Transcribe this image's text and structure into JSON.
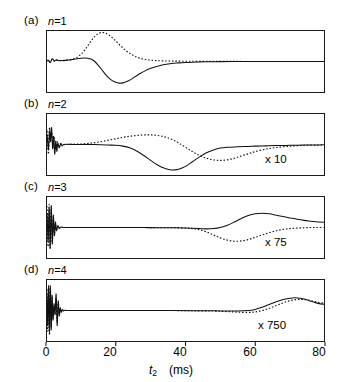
{
  "figure": {
    "panels": [
      {
        "label": "(a)",
        "n_label": "n",
        "n_eq": "=",
        "n_value": "1",
        "multiplier": ""
      },
      {
        "label": "(b)",
        "n_label": "n",
        "n_eq": "=",
        "n_value": "2",
        "multiplier": "x 10"
      },
      {
        "label": "(c)",
        "n_label": "n",
        "n_eq": "=",
        "n_value": "3",
        "multiplier": "x 75"
      },
      {
        "label": "(d)",
        "n_label": "n",
        "n_eq": "=",
        "n_value": "4",
        "multiplier": "x 750"
      }
    ],
    "x_axis": {
      "label_symbol": "t",
      "label_subscript": "2",
      "label_units": "(ms)",
      "ticks": [
        "0",
        "20",
        "40",
        "60",
        "80"
      ],
      "min": 0,
      "max": 80
    }
  },
  "chart_data": {
    "type": "line",
    "title": "",
    "xlabel": "t2 (ms)",
    "ylabel": "",
    "xlim": [
      0,
      80
    ],
    "grid": false,
    "legend": "none",
    "series_styles": {
      "solid": "solid line",
      "dotted": "dotted line"
    },
    "panels": [
      {
        "key": "a",
        "panel_label": "(a)",
        "annotation": "n = 1",
        "multiplier": 1,
        "ylim": [
          -1.15,
          1.15
        ],
        "baseline": 0,
        "solid": {
          "name": "solid",
          "x": [
            0,
            0.6,
            1.2,
            1.8,
            2.4,
            3,
            3.6,
            4.2,
            5,
            6,
            7,
            8,
            9,
            10,
            11,
            12,
            13,
            14,
            15,
            16,
            17,
            18,
            19,
            20,
            21,
            22,
            23,
            24,
            25,
            26,
            27,
            28,
            30,
            32,
            34,
            36,
            38,
            40,
            42,
            44,
            46,
            48,
            50,
            55,
            60,
            65,
            70,
            75,
            80
          ],
          "y": [
            0,
            0.05,
            -0.04,
            0.1,
            0.02,
            0.06,
            0.03,
            0.04,
            0.03,
            0.05,
            0.06,
            0.08,
            0.1,
            0.12,
            0.13,
            0.12,
            0.08,
            0.0,
            -0.14,
            -0.3,
            -0.46,
            -0.6,
            -0.7,
            -0.76,
            -0.79,
            -0.78,
            -0.74,
            -0.68,
            -0.6,
            -0.52,
            -0.44,
            -0.37,
            -0.25,
            -0.17,
            -0.11,
            -0.07,
            -0.05,
            -0.035,
            -0.025,
            -0.018,
            -0.012,
            -0.008,
            -0.005,
            -0.002,
            0,
            0,
            0,
            0,
            0
          ]
        },
        "dotted": {
          "name": "dotted",
          "x": [
            0,
            0.6,
            1.2,
            1.8,
            2.4,
            3,
            4,
            5,
            6,
            7,
            8,
            9,
            10,
            11,
            12,
            13,
            14,
            15,
            16,
            17,
            18,
            19,
            20,
            21,
            22,
            23,
            24,
            25,
            26,
            27,
            28,
            30,
            32,
            34,
            36,
            38,
            40,
            42,
            45,
            48,
            52,
            56,
            60,
            65,
            70,
            75,
            80
          ],
          "y": [
            0,
            0.04,
            -0.02,
            0.08,
            0.01,
            0.05,
            0.03,
            0.04,
            0.05,
            0.07,
            0.1,
            0.16,
            0.26,
            0.4,
            0.58,
            0.76,
            0.92,
            1.02,
            1.06,
            1.04,
            0.97,
            0.87,
            0.75,
            0.62,
            0.5,
            0.39,
            0.3,
            0.22,
            0.16,
            0.12,
            0.09,
            0.05,
            0.03,
            0.02,
            0.015,
            0.012,
            0.01,
            0.008,
            0.006,
            0.004,
            0.003,
            0.002,
            0.001,
            0,
            0,
            0,
            0
          ]
        }
      },
      {
        "key": "b",
        "panel_label": "(b)",
        "annotation": "n = 2",
        "multiplier": 10,
        "ylim": [
          -1.15,
          1.15
        ],
        "baseline": 0,
        "solid": {
          "name": "solid",
          "x": [
            0,
            0.3,
            0.7,
            1.0,
            1.3,
            1.6,
            1.9,
            2.2,
            2.5,
            2.8,
            3.1,
            3.4,
            3.8,
            4.2,
            4.6,
            5,
            6,
            8,
            10,
            12,
            14,
            16,
            18,
            20,
            22,
            24,
            26,
            28,
            30,
            32,
            34,
            36,
            38,
            40,
            42,
            44,
            46,
            48,
            50,
            52,
            55,
            58,
            60,
            63,
            66,
            70,
            74,
            78,
            80
          ],
          "y": [
            0,
            0.35,
            -0.2,
            0.5,
            0.1,
            0.62,
            -0.15,
            0.3,
            -0.35,
            0.12,
            -0.25,
            0.05,
            -0.12,
            0.02,
            -0.05,
            0.0,
            0.01,
            0.0,
            0.0,
            0.0,
            0.0,
            -0.01,
            -0.02,
            -0.03,
            -0.06,
            -0.12,
            -0.24,
            -0.4,
            -0.58,
            -0.75,
            -0.87,
            -0.93,
            -0.9,
            -0.8,
            -0.63,
            -0.45,
            -0.3,
            -0.2,
            -0.13,
            -0.1,
            -0.08,
            -0.07,
            -0.06,
            -0.05,
            -0.04,
            -0.03,
            -0.02,
            -0.015,
            -0.012
          ]
        },
        "dotted": {
          "name": "dotted",
          "x": [
            0,
            0.3,
            0.7,
            1.0,
            1.3,
            1.6,
            2.0,
            2.4,
            2.8,
            3.2,
            3.6,
            4,
            5,
            6,
            8,
            10,
            12,
            14,
            16,
            18,
            20,
            22,
            24,
            26,
            28,
            30,
            32,
            34,
            36,
            38,
            40,
            42,
            44,
            46,
            48,
            50,
            52,
            54,
            56,
            58,
            60,
            63,
            66,
            70,
            74,
            78,
            80
          ],
          "y": [
            0,
            0.55,
            -0.35,
            0.62,
            0.15,
            0.5,
            -0.1,
            0.25,
            -0.2,
            0.1,
            -0.1,
            0.03,
            0.0,
            0.0,
            0.01,
            0.02,
            0.04,
            0.07,
            0.11,
            0.16,
            0.21,
            0.26,
            0.3,
            0.33,
            0.35,
            0.35,
            0.33,
            0.28,
            0.19,
            0.06,
            -0.1,
            -0.26,
            -0.4,
            -0.5,
            -0.56,
            -0.58,
            -0.56,
            -0.5,
            -0.42,
            -0.34,
            -0.26,
            -0.17,
            -0.11,
            -0.06,
            -0.03,
            -0.02,
            -0.015
          ]
        }
      },
      {
        "key": "c",
        "panel_label": "(c)",
        "annotation": "n = 3",
        "multiplier": 75,
        "ylim": [
          -1.15,
          1.15
        ],
        "baseline": 0,
        "solid": {
          "name": "solid",
          "x": [
            0,
            0.3,
            0.6,
            0.9,
            1.2,
            1.5,
            1.8,
            2.1,
            2.4,
            2.7,
            3.0,
            3.4,
            3.8,
            4.2,
            5,
            6,
            8,
            12,
            16,
            20,
            24,
            28,
            32,
            36,
            40,
            42,
            44,
            46,
            48,
            50,
            52,
            54,
            56,
            58,
            60,
            62,
            64,
            66,
            68,
            70,
            72,
            74,
            76,
            78,
            80
          ],
          "y": [
            0,
            0.5,
            -0.5,
            0.7,
            -0.75,
            0.8,
            -0.6,
            0.45,
            -0.3,
            0.2,
            -0.12,
            0.07,
            -0.04,
            0.02,
            0.0,
            0.0,
            0.0,
            0.0,
            0.0,
            0.0,
            0.0,
            0.0,
            -0.01,
            -0.01,
            -0.02,
            -0.03,
            -0.04,
            -0.05,
            -0.04,
            0.0,
            0.08,
            0.2,
            0.33,
            0.44,
            0.5,
            0.52,
            0.5,
            0.45,
            0.4,
            0.35,
            0.3,
            0.26,
            0.23,
            0.2,
            0.19
          ]
        },
        "dotted": {
          "name": "dotted",
          "x": [
            0,
            0.3,
            0.6,
            0.9,
            1.2,
            1.5,
            1.8,
            2.1,
            2.4,
            2.7,
            3.0,
            3.4,
            3.8,
            4.2,
            5,
            6,
            8,
            12,
            16,
            20,
            24,
            28,
            32,
            36,
            40,
            42,
            44,
            46,
            48,
            50,
            52,
            54,
            56,
            58,
            60,
            62,
            64,
            66,
            68,
            70,
            72,
            74,
            76,
            78,
            80
          ],
          "y": [
            0,
            0.75,
            -0.7,
            0.85,
            -0.8,
            0.7,
            -0.5,
            0.35,
            -0.22,
            0.13,
            -0.08,
            0.04,
            -0.02,
            0.01,
            0.0,
            0.0,
            0.0,
            0.0,
            0.0,
            0.0,
            0.0,
            0.0,
            -0.01,
            -0.01,
            -0.02,
            -0.04,
            -0.08,
            -0.16,
            -0.27,
            -0.38,
            -0.46,
            -0.5,
            -0.49,
            -0.44,
            -0.36,
            -0.27,
            -0.19,
            -0.12,
            -0.07,
            -0.04,
            -0.02,
            -0.01,
            0.0,
            0.0,
            0.0
          ]
        }
      },
      {
        "key": "d",
        "panel_label": "(d)",
        "annotation": "n = 4",
        "multiplier": 750,
        "ylim": [
          -1.15,
          1.15
        ],
        "baseline": 0,
        "solid": {
          "name": "solid",
          "x": [
            0,
            0.25,
            0.5,
            0.75,
            1.0,
            1.25,
            1.5,
            1.75,
            2.0,
            2.3,
            2.6,
            2.9,
            3.2,
            3.5,
            3.8,
            4.1,
            4.4,
            4.7,
            5.0,
            5.4,
            6,
            7,
            9,
            13,
            18,
            24,
            30,
            36,
            42,
            48,
            52,
            55,
            58,
            60,
            62,
            64,
            66,
            68,
            70,
            72,
            74,
            76,
            78,
            80
          ],
          "y": [
            0,
            0.6,
            -0.55,
            0.85,
            -0.8,
            0.9,
            -0.7,
            0.55,
            -0.35,
            0.25,
            -0.15,
            0.6,
            -0.55,
            0.35,
            -0.2,
            0.1,
            -0.06,
            0.03,
            -0.02,
            0.01,
            0.0,
            0.0,
            0.0,
            0.0,
            0.0,
            0.0,
            0.0,
            0.0,
            -0.01,
            -0.01,
            -0.02,
            -0.02,
            0.0,
            0.04,
            0.12,
            0.22,
            0.32,
            0.4,
            0.45,
            0.46,
            0.42,
            0.34,
            0.26,
            0.22
          ]
        },
        "dotted": {
          "name": "dotted",
          "x": [
            0,
            0.25,
            0.5,
            0.75,
            1.0,
            1.25,
            1.5,
            1.75,
            2.0,
            2.3,
            2.6,
            2.9,
            3.2,
            3.5,
            3.8,
            4.1,
            4.4,
            4.7,
            5.0,
            5.4,
            6,
            7,
            9,
            13,
            18,
            24,
            30,
            36,
            42,
            48,
            52,
            55,
            58,
            60,
            62,
            64,
            66,
            68,
            70,
            72,
            74,
            76,
            78,
            80
          ],
          "y": [
            0,
            0.8,
            -0.75,
            0.95,
            -0.9,
            0.8,
            -0.6,
            0.45,
            -0.28,
            0.18,
            -0.1,
            0.45,
            -0.4,
            0.25,
            -0.14,
            0.07,
            -0.04,
            0.02,
            -0.01,
            0.0,
            0.0,
            0.0,
            0.0,
            0.0,
            0.0,
            0.0,
            0.0,
            0.0,
            -0.01,
            -0.02,
            -0.04,
            -0.06,
            -0.07,
            -0.05,
            0.0,
            0.08,
            0.18,
            0.28,
            0.36,
            0.4,
            0.4,
            0.36,
            0.3,
            0.26
          ]
        }
      }
    ]
  }
}
